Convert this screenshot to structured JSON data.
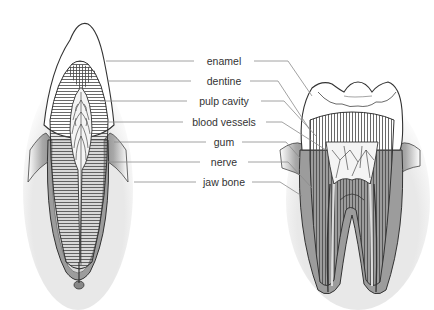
{
  "diagram": {
    "title": "",
    "left_figure": "incisor-cross-section",
    "right_figure": "molar-cross-section",
    "labels": [
      {
        "text": "enamel",
        "x": 224,
        "y": 61
      },
      {
        "text": "dentine",
        "x": 224,
        "y": 81
      },
      {
        "text": "pulp cavity",
        "x": 224,
        "y": 101
      },
      {
        "text": "blood vessels",
        "x": 224,
        "y": 122
      },
      {
        "text": "gum",
        "x": 224,
        "y": 142
      },
      {
        "text": "nerve",
        "x": 224,
        "y": 162
      },
      {
        "text": "jaw bone",
        "x": 224,
        "y": 182
      }
    ],
    "colors": {
      "line": "#333333",
      "leader": "#8a8a8a",
      "gum": "#9a9a9a",
      "enamel": "#ffffff",
      "dentine_hatch": "#555555"
    }
  }
}
